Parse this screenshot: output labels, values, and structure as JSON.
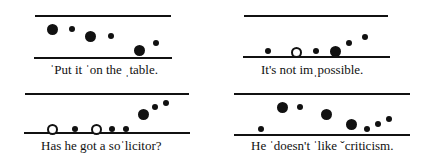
{
  "figure": {
    "panels": [
      {
        "id": "p1",
        "caption": "ˈPut it ˈon the ˌtable.",
        "top_line": {
          "x1": 35,
          "x2": 171,
          "y": 16
        },
        "bottom_line": {
          "x1": 34,
          "x2": 172,
          "y": 58
        },
        "caption_pos": {
          "x": 50,
          "y": 63
        },
        "dots": [
          {
            "type": "big",
            "x": 52,
            "y": 29
          },
          {
            "type": "small",
            "x": 72,
            "y": 29
          },
          {
            "type": "big",
            "x": 90,
            "y": 36
          },
          {
            "type": "small",
            "x": 111,
            "y": 36
          },
          {
            "type": "big",
            "x": 139,
            "y": 50
          },
          {
            "type": "small",
            "x": 156,
            "y": 43
          }
        ]
      },
      {
        "id": "p2",
        "caption": "It's not imˌpossible.",
        "top_line": {
          "x1": 244,
          "x2": 388,
          "y": 16
        },
        "bottom_line": {
          "x1": 243,
          "x2": 390,
          "y": 57
        },
        "caption_pos": {
          "x": 261,
          "y": 63
        },
        "dots": [
          {
            "type": "small",
            "x": 268,
            "y": 51
          },
          {
            "type": "open",
            "x": 296,
            "y": 52
          },
          {
            "type": "small",
            "x": 316,
            "y": 51
          },
          {
            "type": "big",
            "x": 335,
            "y": 51
          },
          {
            "type": "small",
            "x": 349,
            "y": 43
          },
          {
            "type": "small",
            "x": 365,
            "y": 37
          }
        ]
      },
      {
        "id": "p3",
        "caption": "Has he got a soˈlicitor?",
        "top_line": {
          "x1": 25,
          "x2": 189,
          "y": 94
        },
        "bottom_line": {
          "x1": 24,
          "x2": 190,
          "y": 133
        },
        "caption_pos": {
          "x": 41,
          "y": 139
        },
        "dots": [
          {
            "type": "open",
            "x": 52,
            "y": 129
          },
          {
            "type": "small",
            "x": 75,
            "y": 129
          },
          {
            "type": "open",
            "x": 96,
            "y": 129
          },
          {
            "type": "small",
            "x": 112,
            "y": 129
          },
          {
            "type": "small",
            "x": 126,
            "y": 129
          },
          {
            "type": "big",
            "x": 143,
            "y": 114
          },
          {
            "type": "small",
            "x": 155,
            "y": 107
          },
          {
            "type": "small",
            "x": 166,
            "y": 103
          }
        ]
      },
      {
        "id": "p4",
        "caption": "He ˈdoesn't ˈlike ˇcriticism.",
        "top_line": {
          "x1": 234,
          "x2": 410,
          "y": 94
        },
        "bottom_line": {
          "x1": 234,
          "x2": 410,
          "y": 135
        },
        "caption_pos": {
          "x": 251,
          "y": 139
        },
        "dots": [
          {
            "type": "small",
            "x": 261,
            "y": 129
          },
          {
            "type": "big",
            "x": 282,
            "y": 107
          },
          {
            "type": "small",
            "x": 300,
            "y": 107
          },
          {
            "type": "big",
            "x": 326,
            "y": 114
          },
          {
            "type": "big",
            "x": 351,
            "y": 124
          },
          {
            "type": "small",
            "x": 367,
            "y": 129
          },
          {
            "type": "small",
            "x": 378,
            "y": 124
          },
          {
            "type": "small",
            "x": 389,
            "y": 119
          }
        ]
      }
    ]
  }
}
